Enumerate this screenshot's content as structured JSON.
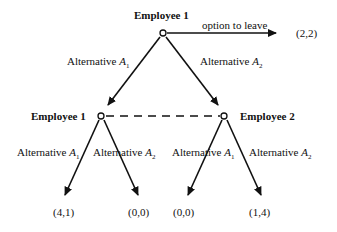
{
  "diagram": {
    "type": "game-tree",
    "root": {
      "player": "Employee 1",
      "leave_option": {
        "label": "option to leave",
        "payoff": "(2,2)"
      },
      "branches": [
        {
          "label_prefix": "Alternative ",
          "label_var": "A",
          "label_sub": "1"
        },
        {
          "label_prefix": "Alternative ",
          "label_var": "A",
          "label_sub": "2"
        }
      ]
    },
    "second_level": [
      {
        "player": "Employee 1",
        "branches": [
          {
            "label_prefix": "Alternative ",
            "label_var": "A",
            "label_sub": "1",
            "payoff": "(4,1)"
          },
          {
            "label_prefix": "Alternative ",
            "label_var": "A",
            "label_sub": "2",
            "payoff": "(0,0)"
          }
        ]
      },
      {
        "player": "Employee 2",
        "branches": [
          {
            "label_prefix": "Alternative ",
            "label_var": "A",
            "label_sub": "1",
            "payoff": "(0,0)"
          },
          {
            "label_prefix": "Alternative ",
            "label_var": "A",
            "label_sub": "2",
            "payoff": "(1,4)"
          }
        ]
      }
    ],
    "information_set": "dashed line connecting second-level nodes"
  }
}
